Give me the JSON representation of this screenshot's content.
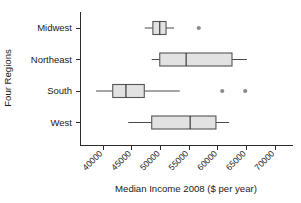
{
  "chart_data": {
    "type": "box",
    "title": "",
    "xlabel": "Median Income 2008 ($ per year)",
    "ylabel": "Four Regions",
    "orientation": "horizontal",
    "grid": false,
    "legend": "none",
    "xlim": [
      36000,
      72000
    ],
    "xticks": [
      40000,
      45000,
      50000,
      55000,
      60000,
      65000,
      70000
    ],
    "xticklabels": [
      "40000",
      "45000",
      "50000",
      "55000",
      "60000",
      "65000",
      "70000"
    ],
    "categories": [
      "Midwest",
      "Northeast",
      "South",
      "West"
    ],
    "boxes": [
      {
        "category": "Midwest",
        "whisker_low": 47300,
        "q1": 48700,
        "median": 49900,
        "q3": 51000,
        "whisker_high": 52400,
        "outliers": [
          56700
        ]
      },
      {
        "category": "Northeast",
        "whisker_low": 48500,
        "q1": 49900,
        "median": 54500,
        "q3": 62500,
        "whisker_high": 65100,
        "outliers": []
      },
      {
        "category": "South",
        "whisker_low": 38800,
        "q1": 41700,
        "median": 44000,
        "q3": 47200,
        "whisker_high": 53400,
        "outliers": [
          60800,
          64800
        ]
      },
      {
        "category": "West",
        "whisker_low": 44400,
        "q1": 48500,
        "median": 55200,
        "q3": 59700,
        "whisker_high": 62000,
        "outliers": []
      }
    ],
    "colors": {
      "box_fill": "#e2e2e2",
      "box_stroke": "#555555",
      "median": "#2b2b2b",
      "whisker": "#4a4a4a",
      "outlier": "#8a8a8a",
      "axis": "#2b2b2b",
      "text": "#1a1a1a",
      "background": "#ffffff"
    }
  }
}
